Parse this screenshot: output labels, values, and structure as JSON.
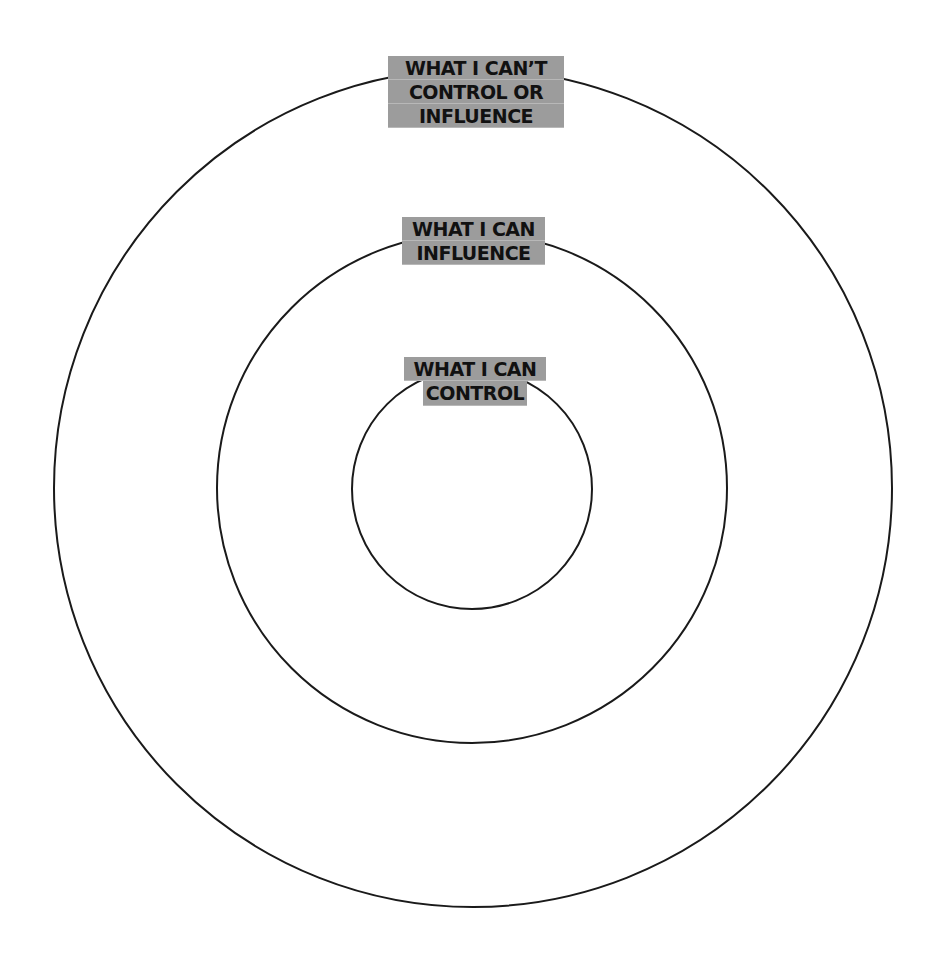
{
  "diagram": {
    "colors": {
      "background": "#ffffff",
      "ring_stroke": "#1a1a1a",
      "label_highlight": "#9c9c9c",
      "label_text": "#111111"
    },
    "rings": [
      {
        "id": "outer",
        "center": [
          473,
          488
        ],
        "radius": 420,
        "label_lines": [
          "WHAT I CAN’T",
          "CONTROL OR",
          "INFLUENCE"
        ]
      },
      {
        "id": "middle",
        "center": [
          472,
          488
        ],
        "radius": 256,
        "label_lines": [
          "WHAT I CAN",
          "INFLUENCE"
        ]
      },
      {
        "id": "inner",
        "center": [
          472,
          489
        ],
        "radius": 121,
        "label_lines": [
          "WHAT I CAN",
          "CONTROL"
        ]
      }
    ]
  }
}
